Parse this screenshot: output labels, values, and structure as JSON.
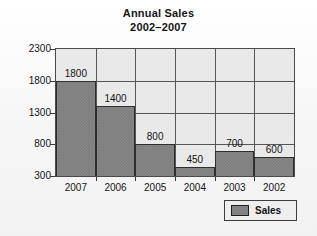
{
  "chart_data": {
    "type": "bar",
    "title": "Annual Sales",
    "subtitle": "2002–2007",
    "title_lines": [
      "Annual Sales",
      "2002–2007"
    ],
    "categories": [
      "2007",
      "2006",
      "2005",
      "2004",
      "2003",
      "2002"
    ],
    "values": [
      1800,
      1400,
      800,
      450,
      700,
      600
    ],
    "data_labels": [
      "1800",
      "1400",
      "800",
      "450",
      "700",
      "600"
    ],
    "series": [
      {
        "name": "Sales",
        "values": [
          1800,
          1400,
          800,
          450,
          700,
          600
        ],
        "color": "#7e7e7e"
      }
    ],
    "xlabel": "",
    "ylabel": "",
    "ylim": [
      300,
      2300
    ],
    "ytick_step": 500,
    "ytick_labels": [
      "2300",
      "1800",
      "1300",
      "800",
      "300"
    ],
    "ytick_values": [
      2300,
      1800,
      1300,
      800,
      300
    ],
    "xtick_labels": [
      "2007",
      "2006",
      "2005",
      "2004",
      "2003",
      "2002"
    ],
    "grid": true,
    "grid_axes": "both",
    "legend": {
      "position": "bottom-right",
      "entries": [
        {
          "label": "Sales",
          "color": "#7e7e7e"
        }
      ]
    },
    "colors": {
      "bar_fill": "#7e7e7e",
      "bar_edge": "#2e2e2e",
      "plot_background": "#e9e9e9",
      "grid": "#555555",
      "frame": "#4a4a4a",
      "page_background": "#f6f6f6",
      "text": "#141414"
    }
  }
}
